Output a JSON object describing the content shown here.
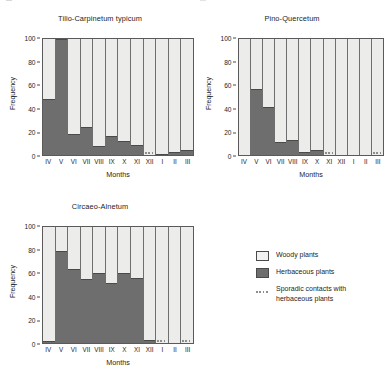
{
  "figure": {
    "axis_label_x": "Months",
    "axis_label_y": "Frequency",
    "y_ticks": [
      "100",
      "80",
      "60",
      "40",
      "20",
      "0"
    ],
    "months": [
      "IV",
      "V",
      "VI",
      "VII",
      "VIII",
      "IX",
      "X",
      "XI",
      "XII",
      "I",
      "II",
      "III"
    ],
    "colors": {
      "woody": "#ececeb",
      "herbaceous": "#6e6e6e",
      "sporadic": "#8e8e8e",
      "axis": "#4a4a4a",
      "text": "#1d1d1d",
      "background": "#ffffff"
    }
  },
  "legend": {
    "items": [
      {
        "swatch": "woody",
        "label": "Woody plants"
      },
      {
        "swatch": "herbaceous",
        "label": "Herbaceous plants"
      },
      {
        "swatch": "sporadic",
        "label": "Sporadic contacts with\nherbaceous plants"
      }
    ]
  },
  "chart_data": [
    {
      "type": "bar",
      "title": "Tilio-Carpinetum typicum",
      "xlabel": "Months",
      "ylabel": "Frequency",
      "ylim": [
        0,
        100
      ],
      "yticks": [
        0,
        20,
        40,
        60,
        80,
        100
      ],
      "stacked": true,
      "grid": false,
      "categories": [
        "IV",
        "V",
        "VI",
        "VII",
        "VIII",
        "IX",
        "X",
        "XI",
        "XII",
        "I",
        "II",
        "III"
      ],
      "series": [
        {
          "name": "Herbaceous plants",
          "values": [
            48,
            100,
            18,
            24,
            8,
            16,
            12,
            9,
            0,
            1,
            3,
            4
          ]
        },
        {
          "name": "Woody plants",
          "values": [
            52,
            0,
            82,
            76,
            92,
            84,
            88,
            91,
            100,
            99,
            97,
            96
          ]
        }
      ],
      "sporadic_contacts": [
        "XII"
      ]
    },
    {
      "type": "bar",
      "title": "Pino-Quercetum",
      "xlabel": "Months",
      "ylabel": "Frequency",
      "ylim": [
        0,
        100
      ],
      "yticks": [
        0,
        20,
        40,
        60,
        80,
        100
      ],
      "stacked": true,
      "grid": false,
      "categories": [
        "IV",
        "V",
        "VI",
        "VII",
        "VIII",
        "IX",
        "X",
        "XI",
        "XII",
        "I",
        "II",
        "III"
      ],
      "series": [
        {
          "name": "Herbaceous plants",
          "values": [
            0,
            57,
            41,
            11,
            13,
            3,
            4,
            0,
            0,
            0,
            0,
            0
          ]
        },
        {
          "name": "Woody plants",
          "values": [
            100,
            43,
            59,
            89,
            87,
            97,
            96,
            100,
            100,
            100,
            100,
            100
          ]
        }
      ],
      "sporadic_contacts": [
        "XI",
        "III"
      ]
    },
    {
      "type": "bar",
      "title": "Circaeo-Alnetum",
      "xlabel": "Months",
      "ylabel": "Frequency",
      "ylim": [
        0,
        100
      ],
      "yticks": [
        0,
        20,
        40,
        60,
        80,
        100
      ],
      "stacked": true,
      "grid": false,
      "categories": [
        "IV",
        "V",
        "VI",
        "VII",
        "VIII",
        "IX",
        "X",
        "XI",
        "XII",
        "I",
        "II",
        "III"
      ],
      "series": [
        {
          "name": "Herbaceous plants",
          "values": [
            2,
            79,
            64,
            55,
            60,
            52,
            60,
            56,
            3,
            0,
            0,
            0
          ]
        },
        {
          "name": "Woody plants",
          "values": [
            98,
            21,
            36,
            45,
            40,
            48,
            40,
            44,
            97,
            100,
            100,
            100
          ]
        }
      ],
      "sporadic_contacts": [
        "I",
        "III"
      ]
    }
  ]
}
